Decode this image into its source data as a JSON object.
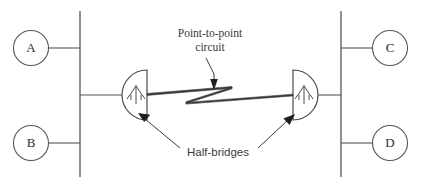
{
  "diagram": {
    "background_color": "#ffffff",
    "line_color": "#555555",
    "text_color": "#3a3a3a",
    "nodes": [
      {
        "id": "A",
        "label": "A",
        "position": "top-left"
      },
      {
        "id": "B",
        "label": "B",
        "position": "bottom-left"
      },
      {
        "id": "C",
        "label": "C",
        "position": "top-right"
      },
      {
        "id": "D",
        "label": "D",
        "position": "bottom-right"
      }
    ],
    "buses": [
      {
        "id": "left-bus",
        "side": "left"
      },
      {
        "id": "right-bus",
        "side": "right"
      }
    ],
    "half_bridges": [
      {
        "id": "left-half-bridge",
        "side": "left",
        "icon": "half-bridge-icon"
      },
      {
        "id": "right-half-bridge",
        "side": "right",
        "icon": "half-bridge-icon"
      }
    ],
    "link": {
      "id": "point-to-point-link",
      "icon": "lightning-bolt-icon"
    },
    "callouts": [
      {
        "id": "point-to-point-callout",
        "line1": "Point-to-point",
        "line2": "circuit",
        "font": "serif",
        "arrow": "down"
      },
      {
        "id": "half-bridges-callout",
        "text": "Half-bridges",
        "font": "sans",
        "arrow": "up-both"
      }
    ]
  }
}
